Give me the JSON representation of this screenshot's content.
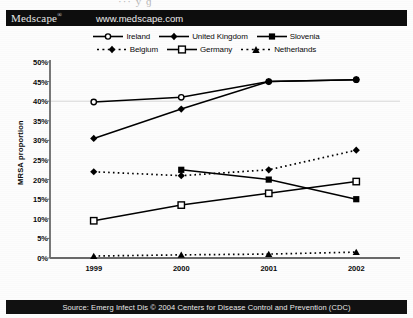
{
  "header": {
    "brand": "Medscape",
    "brand_mark": "®",
    "url": "www.medscape.com",
    "scan_artifact": "··· у ɡ"
  },
  "footer": {
    "source": "Source: Emerg Infect Dis © 2004 Centers for Disease Control and Prevention (CDC)"
  },
  "chart_data": {
    "type": "line",
    "title": "",
    "xlabel": "",
    "ylabel": "MRSA proportion",
    "x": [
      "1999",
      "2000",
      "2001",
      "2002"
    ],
    "xtick_labels": [
      "1999",
      "2000",
      "2001",
      "2002"
    ],
    "ytick_labels": [
      "0%",
      "5%",
      "10%",
      "15%",
      "20%",
      "25%",
      "30%",
      "35%",
      "40%",
      "45%",
      "50%"
    ],
    "ytick_values": [
      0,
      5,
      10,
      15,
      20,
      25,
      30,
      35,
      40,
      45,
      50
    ],
    "ylim": [
      0,
      50
    ],
    "y_unit": "%",
    "grid": "single horizontal gridline at 40%",
    "gridline_values": [
      40
    ],
    "legend_position": "above plot, two centered rows",
    "series": [
      {
        "name": "Ireland",
        "marker": "open-circle",
        "line": "solid",
        "values": [
          39.8,
          41.0,
          45.0,
          45.5
        ]
      },
      {
        "name": "United Kingdom",
        "marker": "filled-diamond",
        "line": "solid",
        "values": [
          30.5,
          38.0,
          45.0,
          45.5
        ]
      },
      {
        "name": "Slovenia",
        "marker": "filled-square",
        "line": "solid",
        "values": [
          null,
          22.5,
          20.0,
          15.0
        ]
      },
      {
        "name": "Belgium",
        "marker": "filled-diamond",
        "line": "dashed",
        "values": [
          22.0,
          21.0,
          22.5,
          27.5
        ]
      },
      {
        "name": "Germany",
        "marker": "open-square",
        "line": "solid",
        "values": [
          9.5,
          13.5,
          16.5,
          19.5
        ]
      },
      {
        "name": "Netherlands",
        "marker": "filled-triangle",
        "line": "dashed",
        "values": [
          0.5,
          0.8,
          1.0,
          1.5
        ]
      }
    ]
  },
  "colors": {
    "series": "#000000",
    "header_bg": "#0d0d0d",
    "footer_bg": "#111111",
    "axis": "#6a6a6a",
    "gridline": "#d8d8d8",
    "page_bg": "#fdfdfd"
  }
}
